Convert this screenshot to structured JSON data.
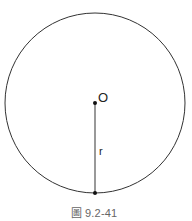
{
  "figure": {
    "caption": "圖 9.2-41",
    "circle": {
      "center": {
        "x": 95,
        "y": 103
      },
      "radius": 90,
      "stroke_color": "#333333"
    },
    "center_point": {
      "label": "O",
      "x": 95,
      "y": 103
    },
    "radius_segment": {
      "label": "r",
      "from": {
        "x": 95,
        "y": 103
      },
      "to": {
        "x": 95,
        "y": 193
      },
      "color": "#555555"
    },
    "edge_point": {
      "x": 95,
      "y": 193
    },
    "point_color": "#111111"
  }
}
